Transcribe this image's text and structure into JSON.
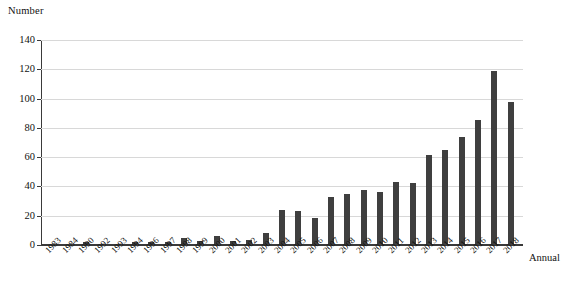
{
  "chart_data": {
    "type": "bar",
    "title": "",
    "ylabel": "Number",
    "xlabel": "Annual",
    "ylim": [
      0,
      140
    ],
    "ytick_step": 20,
    "yticks": [
      0,
      20,
      40,
      60,
      80,
      100,
      120,
      140
    ],
    "grid": "horizontal",
    "legend": "none",
    "bar_color": "#3f3f3f",
    "categories": [
      "1983",
      "1984",
      "1990",
      "1992",
      "1993",
      "1994",
      "1996",
      "1997",
      "1998",
      "1999",
      "2000",
      "2001",
      "2002",
      "2003",
      "2004",
      "2005",
      "2006",
      "2007",
      "2008",
      "2009",
      "2010",
      "2011",
      "2012",
      "2013",
      "2014",
      "2015",
      "2016",
      "2017",
      "2018"
    ],
    "values": [
      1,
      1,
      2,
      1,
      1,
      2,
      2,
      2,
      5,
      2.5,
      6,
      3,
      3.5,
      8,
      24,
      23,
      18.5,
      33,
      34.5,
      37.5,
      36.5,
      43,
      42.5,
      61.5,
      65,
      73.5,
      85.5,
      118.5,
      97.5
    ]
  },
  "axes": {
    "y_axis_title": "Number",
    "x_axis_title": "Annual"
  }
}
